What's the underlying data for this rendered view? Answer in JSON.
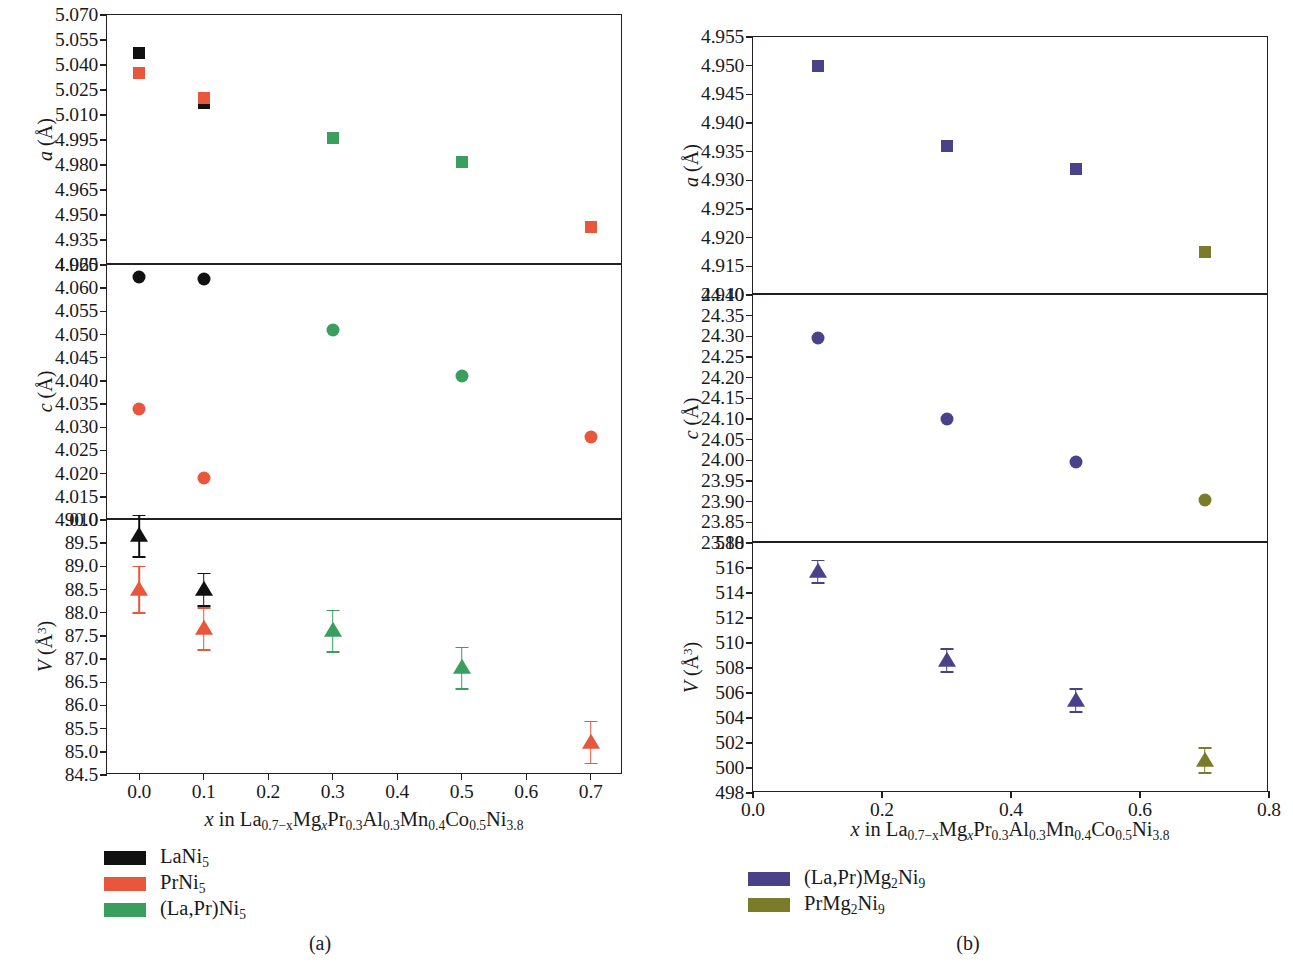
{
  "figure": {
    "panel_a_tag": "(a)",
    "panel_b_tag": "(b)"
  },
  "panel_a": {
    "xtitle_prefix": "x",
    "xtitle_rest": " in La",
    "xtitle_full": "x in La0.7−xMgxPr0.3Al0.3Mn0.4Co0.5Ni3.8",
    "xticks": [
      "0.0",
      "0.1",
      "0.2",
      "0.3",
      "0.4",
      "0.5",
      "0.6",
      "0.7"
    ],
    "sub_a": {
      "ylabel_var": "a",
      "ylabel_unit": " (Å)",
      "yticks": [
        "5.070",
        "5.055",
        "5.040",
        "5.025",
        "5.010",
        "4.995",
        "4.980",
        "4.965",
        "4.950",
        "4.935",
        "4.920"
      ]
    },
    "sub_c": {
      "ylabel_var": "c",
      "ylabel_unit": " (Å)",
      "yticks": [
        "4.065",
        "4.060",
        "4.055",
        "4.050",
        "4.045",
        "4.040",
        "4.035",
        "4.030",
        "4.025",
        "4.020",
        "4.015",
        "4.010"
      ]
    },
    "sub_v": {
      "ylabel_var": "V",
      "ylabel_unit": " (Å3)",
      "yticks": [
        "90.0",
        "89.5",
        "89.0",
        "88.5",
        "88.0",
        "87.5",
        "87.0",
        "86.5",
        "86.0",
        "85.5",
        "85.0",
        "84.5"
      ]
    },
    "legend": [
      {
        "label": "LaNi5",
        "color": "#111111"
      },
      {
        "label": "PrNi5",
        "color": "#e8573c"
      },
      {
        "label": "(La,Pr)Ni5",
        "color": "#3a9f5e"
      }
    ]
  },
  "panel_b": {
    "xtitle_full": "x in La0.7−xMgxPr0.3Al0.3Mn0.4Co0.5Ni3.8",
    "xticks": [
      "0.0",
      "0.2",
      "0.4",
      "0.6",
      "0.8"
    ],
    "sub_a": {
      "ylabel_var": "a",
      "ylabel_unit": " (Å)",
      "yticks": [
        "4.955",
        "4.950",
        "4.945",
        "4.940",
        "4.935",
        "4.930",
        "4.925",
        "4.920",
        "4.915",
        "4.910"
      ]
    },
    "sub_c": {
      "ylabel_var": "c",
      "ylabel_unit": " (Å)",
      "yticks": [
        "24.40",
        "24.35",
        "24.30",
        "24.25",
        "24.20",
        "24.15",
        "24.10",
        "24.05",
        "24.00",
        "23.95",
        "23.90",
        "23.85",
        "23.80"
      ]
    },
    "sub_v": {
      "ylabel_var": "V",
      "ylabel_unit": " (Å3)",
      "yticks": [
        "518",
        "516",
        "514",
        "512",
        "510",
        "508",
        "506",
        "504",
        "502",
        "500",
        "498"
      ]
    },
    "legend": [
      {
        "label": "(La,Pr)Mg2Ni9",
        "color": "#4a4288"
      },
      {
        "label": "PrMg2Ni9",
        "color": "#7b7b2c"
      }
    ]
  },
  "chart_data": [
    {
      "type": "scatter",
      "panel": "a",
      "subplot": "a-lattice",
      "title": "",
      "xlabel": "x in La0.7-xMgxPr0.3Al0.3Mn0.4Co0.5Ni3.8",
      "ylabel": "a (Å)",
      "xlim": [
        -0.05,
        0.75
      ],
      "ylim": [
        4.92,
        5.07
      ],
      "ytick_step": 0.015,
      "grid": false,
      "legend_position": "below-left",
      "series": [
        {
          "name": "LaNi5",
          "color": "#111111",
          "marker": "square",
          "points": [
            {
              "x": 0.0,
              "y": 5.047
            },
            {
              "x": 0.1,
              "y": 5.017
            }
          ]
        },
        {
          "name": "PrNi5",
          "color": "#e8573c",
          "marker": "square",
          "points": [
            {
              "x": 0.0,
              "y": 5.035
            },
            {
              "x": 0.1,
              "y": 5.02
            },
            {
              "x": 0.7,
              "y": 4.943
            }
          ]
        },
        {
          "name": "(La,Pr)Ni5",
          "color": "#3a9f5e",
          "marker": "square",
          "points": [
            {
              "x": 0.3,
              "y": 4.996
            },
            {
              "x": 0.5,
              "y": 4.982
            }
          ]
        }
      ]
    },
    {
      "type": "scatter",
      "panel": "a",
      "subplot": "c-lattice",
      "xlabel": "x in La0.7-xMgxPr0.3Al0.3Mn0.4Co0.5Ni3.8",
      "ylabel": "c (Å)",
      "xlim": [
        -0.05,
        0.75
      ],
      "ylim": [
        4.01,
        4.065
      ],
      "ytick_step": 0.005,
      "grid": false,
      "series": [
        {
          "name": "LaNi5",
          "color": "#111111",
          "marker": "circle",
          "points": [
            {
              "x": 0.0,
              "y": 4.0625
            },
            {
              "x": 0.1,
              "y": 4.062
            }
          ]
        },
        {
          "name": "PrNi5",
          "color": "#e8573c",
          "marker": "circle",
          "points": [
            {
              "x": 0.0,
              "y": 4.034
            },
            {
              "x": 0.1,
              "y": 4.019
            },
            {
              "x": 0.7,
              "y": 4.028
            }
          ]
        },
        {
          "name": "(La,Pr)Ni5",
          "color": "#3a9f5e",
          "marker": "circle",
          "points": [
            {
              "x": 0.3,
              "y": 4.051
            },
            {
              "x": 0.5,
              "y": 4.041
            }
          ]
        }
      ]
    },
    {
      "type": "scatter",
      "panel": "a",
      "subplot": "V-volume",
      "xlabel": "x in La0.7-xMgxPr0.3Al0.3Mn0.4Co0.5Ni3.8",
      "ylabel": "V (Å3)",
      "xlim": [
        -0.05,
        0.75
      ],
      "ylim": [
        84.5,
        90.0
      ],
      "ytick_step": 0.5,
      "grid": false,
      "errorbars": true,
      "series": [
        {
          "name": "LaNi5",
          "color": "#111111",
          "marker": "triangle",
          "points": [
            {
              "x": 0.0,
              "y": 89.65,
              "err": 0.45
            },
            {
              "x": 0.1,
              "y": 88.5,
              "err": 0.35
            }
          ]
        },
        {
          "name": "PrNi5",
          "color": "#e8573c",
          "marker": "triangle",
          "points": [
            {
              "x": 0.0,
              "y": 88.5,
              "err": 0.5
            },
            {
              "x": 0.1,
              "y": 87.65,
              "err": 0.45
            },
            {
              "x": 0.7,
              "y": 85.2,
              "err": 0.45
            }
          ]
        },
        {
          "name": "(La,Pr)Ni5",
          "color": "#3a9f5e",
          "marker": "triangle",
          "points": [
            {
              "x": 0.3,
              "y": 87.6,
              "err": 0.45
            },
            {
              "x": 0.5,
              "y": 86.8,
              "err": 0.45
            }
          ]
        }
      ]
    },
    {
      "type": "scatter",
      "panel": "b",
      "subplot": "a-lattice",
      "xlabel": "x in La0.7-xMgxPr0.3Al0.3Mn0.4Co0.5Ni3.8",
      "ylabel": "a (Å)",
      "xlim": [
        0.0,
        0.8
      ],
      "ylim": [
        4.91,
        4.955
      ],
      "ytick_step": 0.005,
      "grid": false,
      "legend_position": "below-left",
      "series": [
        {
          "name": "(La,Pr)Mg2Ni9",
          "color": "#4a4288",
          "marker": "square",
          "points": [
            {
              "x": 0.1,
              "y": 4.95
            },
            {
              "x": 0.3,
              "y": 4.936
            },
            {
              "x": 0.5,
              "y": 4.932
            }
          ]
        },
        {
          "name": "PrMg2Ni9",
          "color": "#7b7b2c",
          "marker": "square",
          "points": [
            {
              "x": 0.7,
              "y": 4.9175
            }
          ]
        }
      ]
    },
    {
      "type": "scatter",
      "panel": "b",
      "subplot": "c-lattice",
      "xlabel": "x in La0.7-xMgxPr0.3Al0.3Mn0.4Co0.5Ni3.8",
      "ylabel": "c (Å)",
      "xlim": [
        0.0,
        0.8
      ],
      "ylim": [
        23.8,
        24.4
      ],
      "ytick_step": 0.05,
      "grid": false,
      "series": [
        {
          "name": "(La,Pr)Mg2Ni9",
          "color": "#4a4288",
          "marker": "circle",
          "points": [
            {
              "x": 0.1,
              "y": 24.295
            },
            {
              "x": 0.3,
              "y": 24.1
            },
            {
              "x": 0.5,
              "y": 23.995
            }
          ]
        },
        {
          "name": "PrMg2Ni9",
          "color": "#7b7b2c",
          "marker": "circle",
          "points": [
            {
              "x": 0.7,
              "y": 23.905
            }
          ]
        }
      ]
    },
    {
      "type": "scatter",
      "panel": "b",
      "subplot": "V-volume",
      "xlabel": "x in La0.7-xMgxPr0.3Al0.3Mn0.4Co0.5Ni3.8",
      "ylabel": "V (Å3)",
      "xlim": [
        0.0,
        0.8
      ],
      "ylim": [
        498,
        518
      ],
      "ytick_step": 2,
      "grid": false,
      "errorbars": true,
      "series": [
        {
          "name": "(La,Pr)Mg2Ni9",
          "color": "#4a4288",
          "marker": "triangle",
          "points": [
            {
              "x": 0.1,
              "y": 515.7,
              "err": 0.9
            },
            {
              "x": 0.3,
              "y": 508.6,
              "err": 0.9
            },
            {
              "x": 0.5,
              "y": 505.4,
              "err": 0.9
            }
          ]
        },
        {
          "name": "PrMg2Ni9",
          "color": "#7b7b2c",
          "marker": "triangle",
          "points": [
            {
              "x": 0.7,
              "y": 500.6,
              "err": 1.0
            }
          ]
        }
      ]
    }
  ]
}
